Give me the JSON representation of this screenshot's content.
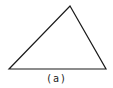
{
  "figure": {
    "caption": "(a)",
    "shape": "triangle",
    "vertices": [
      [
        9,
        69
      ],
      [
        70,
        6
      ],
      [
        106,
        69
      ]
    ],
    "stroke_color": "#1a1a1a",
    "background": "#ffffff"
  }
}
